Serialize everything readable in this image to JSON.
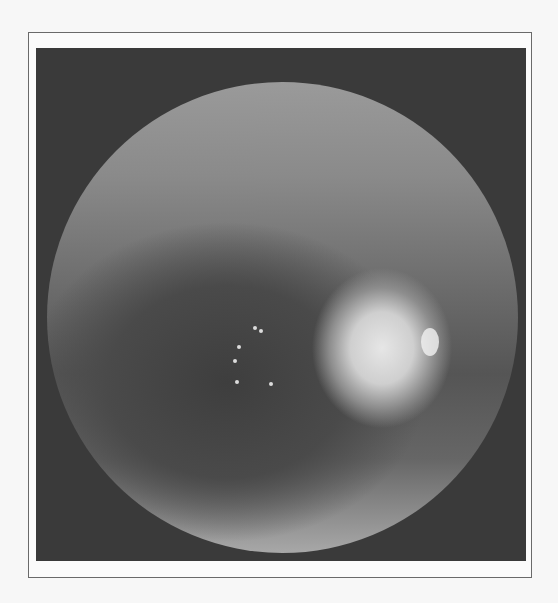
{
  "image": {
    "description": "grayscale fundus photograph with circular field of view and bright optic disc",
    "colors": {
      "background": "#f7f7f7",
      "frame": "#6a6a6a",
      "surround": "#3a3a3a",
      "disc": "#e6e6e6"
    }
  }
}
